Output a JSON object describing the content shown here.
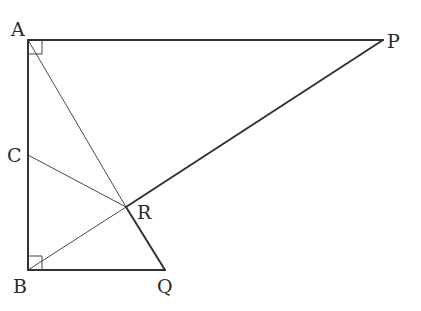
{
  "diagram": {
    "type": "geometry",
    "points": {
      "A": {
        "label": "A",
        "x": 28,
        "y": 40
      },
      "P": {
        "label": "P",
        "x": 383,
        "y": 40
      },
      "B": {
        "label": "B",
        "x": 28,
        "y": 270
      },
      "Q": {
        "label": "Q",
        "x": 165,
        "y": 270
      },
      "C": {
        "label": "C",
        "x": 28,
        "y": 155
      },
      "R": {
        "label": "R",
        "x": 126,
        "y": 207
      }
    },
    "segments": [
      {
        "from": "A",
        "to": "P",
        "weight": "thick"
      },
      {
        "from": "A",
        "to": "B",
        "weight": "thick"
      },
      {
        "from": "B",
        "to": "Q",
        "weight": "thick"
      },
      {
        "from": "R",
        "to": "Q",
        "weight": "thick"
      },
      {
        "from": "R",
        "to": "P",
        "weight": "thick"
      },
      {
        "from": "A",
        "to": "R",
        "weight": "thin"
      },
      {
        "from": "B",
        "to": "R",
        "weight": "thin"
      },
      {
        "from": "C",
        "to": "R",
        "weight": "thin"
      }
    ],
    "right_angles": [
      "A",
      "B"
    ],
    "labels": {
      "A": "A",
      "B": "B",
      "C": "C",
      "P": "P",
      "Q": "Q",
      "R": "R"
    }
  }
}
